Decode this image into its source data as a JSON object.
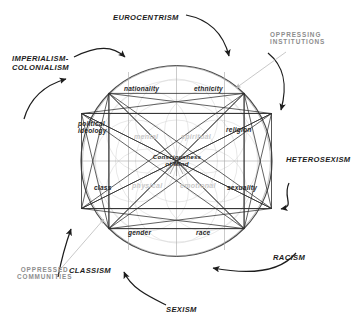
{
  "diagram": {
    "type": "concept-wheel",
    "center_label": "Consciousness\nof Mind",
    "colors": {
      "ink": "#1c1c1c",
      "gray_annotation": "#8d8d8d",
      "faint_geometry": "#c9c9c9",
      "background": "#ffffff"
    }
  },
  "outer_labels": [
    {
      "id": "eurocentrism",
      "text": "EUROCENTRISM",
      "style": "dark"
    },
    {
      "id": "oppressing-institutions",
      "text": "OPPRESSING\nINSTITUTIONS",
      "style": "gray"
    },
    {
      "id": "heterosexism",
      "text": "HETEROSEXISM",
      "style": "dark"
    },
    {
      "id": "racism",
      "text": "RACISM",
      "style": "dark"
    },
    {
      "id": "sexism",
      "text": "SEXISM",
      "style": "dark"
    },
    {
      "id": "classism",
      "text": "CLASSISM",
      "style": "dark"
    },
    {
      "id": "oppressed-communities",
      "text": "OPPRESSED\nCOMMUNITIES",
      "style": "gray"
    },
    {
      "id": "imperialism-colonialism",
      "text": "IMPERIALISM-\nCOLONIALISM",
      "style": "dark"
    }
  ],
  "inner_labels": [
    {
      "id": "nationality",
      "text": "nationality"
    },
    {
      "id": "ethnicity",
      "text": "ethnicity"
    },
    {
      "id": "political-ideology",
      "text": "political\nideology"
    },
    {
      "id": "religion",
      "text": "religion"
    },
    {
      "id": "class",
      "text": "class"
    },
    {
      "id": "sexuality",
      "text": "sexuality"
    },
    {
      "id": "gender",
      "text": "gender"
    },
    {
      "id": "race",
      "text": "race"
    }
  ],
  "faint_labels": [
    {
      "id": "mental",
      "text": "mental"
    },
    {
      "id": "spiritual",
      "text": "spiritual"
    },
    {
      "id": "physical",
      "text": "physical"
    },
    {
      "id": "emotional",
      "text": "emotional"
    }
  ]
}
